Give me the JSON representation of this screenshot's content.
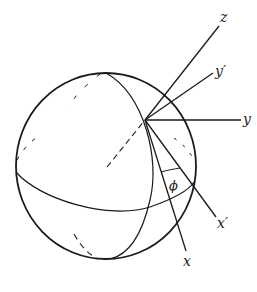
{
  "diagram": {
    "labels": {
      "z": "z",
      "y_prime": "y′",
      "y": "y",
      "x_prime": "x′",
      "x": "x",
      "phi": "ϕ"
    },
    "colors": {
      "stroke": "#1a1a1a",
      "background": "#ffffff"
    }
  }
}
